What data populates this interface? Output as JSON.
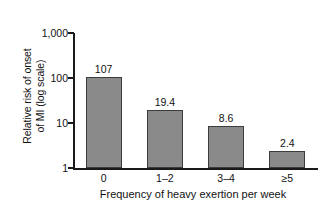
{
  "chart_data": {
    "type": "bar",
    "title": "",
    "xlabel": "Frequency of heavy exertion per week",
    "ylabel_line1": "Relative risk of onset",
    "ylabel_line2": "of MI (log scale)",
    "categories": [
      "0",
      "1–2",
      "3–4",
      "≥5"
    ],
    "values": [
      107,
      19.4,
      8.6,
      2.4
    ],
    "value_labels": [
      "107",
      "19.4",
      "8.6",
      "2.4"
    ],
    "yticks": [
      1,
      10,
      100,
      1000
    ],
    "ytick_labels": [
      "1",
      "10",
      "100",
      "1,000"
    ],
    "ylim": [
      1,
      2000
    ],
    "yscale": "log",
    "grid": false,
    "legend": false,
    "bar_color": "#8a8a8a",
    "bar_edge_color": "#3c3c3c",
    "axis_color": "#1a1a1a",
    "background": "#ffffff"
  }
}
